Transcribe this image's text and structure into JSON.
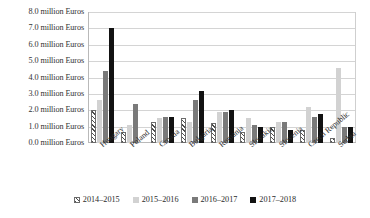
{
  "chart_data": {
    "type": "bar",
    "title": "",
    "xlabel": "",
    "ylabel": "",
    "ylim": [
      0,
      8
    ],
    "grid": true,
    "legend_position": "bottom",
    "categories": [
      "Hungary",
      "Poland",
      "Croatia",
      "Bulgaria",
      "Romania",
      "Slovakia",
      "Slovenia",
      "Czech Republic",
      "Serbia"
    ],
    "ytick_labels": [
      "8.0 million Euros",
      "7.0 million Euros",
      "6.0 million Euros",
      "5.0 million Euros",
      "4.0 million Euros",
      "3.0 million Euros",
      "2.0 million Euros",
      "1.0 million Euros",
      "0.0 million Euros"
    ],
    "ytick_values": [
      8,
      7,
      6,
      5,
      4,
      3,
      2,
      1,
      0
    ],
    "series": [
      {
        "name": "2014–2015",
        "style": "hatched",
        "color": "#f2f2f2",
        "values": [
          2.0,
          0.7,
          1.3,
          1.5,
          1.2,
          0.7,
          1.0,
          0.8,
          0.3
        ]
      },
      {
        "name": "2015–2016",
        "style": "solid",
        "color": "#d2d2d2",
        "values": [
          2.6,
          1.1,
          1.5,
          1.3,
          1.9,
          1.5,
          1.3,
          2.2,
          4.6
        ]
      },
      {
        "name": "2016–2017",
        "style": "solid",
        "color": "#7a7a7a",
        "values": [
          4.4,
          2.4,
          1.6,
          2.6,
          1.9,
          1.1,
          1.3,
          1.6,
          1.0
        ]
      },
      {
        "name": "2017–2018",
        "style": "solid",
        "color": "#121212",
        "values": [
          7.0,
          0.0,
          1.6,
          3.2,
          2.0,
          1.0,
          0.8,
          1.8,
          1.0
        ]
      }
    ]
  }
}
